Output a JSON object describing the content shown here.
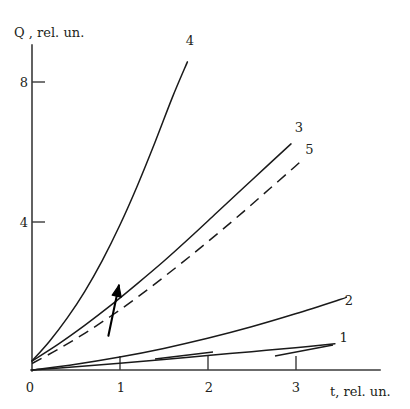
{
  "chart_data": {
    "type": "line",
    "title": "",
    "xlabel": "t, rel. un.",
    "ylabel": "Q , rel. un.",
    "xlim": [
      0,
      3.9
    ],
    "ylim": [
      0,
      9.6
    ],
    "xticks": [
      0,
      1,
      2,
      3
    ],
    "xtick_labels": [
      "0",
      "1",
      "2",
      "3"
    ],
    "yticks": [
      4,
      8
    ],
    "ytick_labels": [
      "4",
      "8"
    ],
    "grid": false,
    "legend": "inline-end-labels",
    "annotations": [
      {
        "name": "upward-arrow",
        "description": "arrow pointing up-left between curves near t=0.9",
        "from_xy": [
          0.87,
          0.95
        ],
        "to_xy": [
          0.99,
          2.35
        ]
      }
    ],
    "series": [
      {
        "name": "1",
        "label": "1",
        "style": "solid",
        "label_xy": [
          3.55,
          0.78
        ],
        "points": [
          [
            0.0,
            0.0
          ],
          [
            0.5,
            0.09
          ],
          [
            1.0,
            0.19
          ],
          [
            1.5,
            0.29
          ],
          [
            2.0,
            0.4
          ],
          [
            2.5,
            0.51
          ],
          [
            3.0,
            0.62
          ],
          [
            3.45,
            0.73
          ]
        ]
      },
      {
        "name": "2",
        "label": "2",
        "style": "solid",
        "label_xy": [
          3.61,
          1.82
        ],
        "points": [
          [
            0.0,
            0.0
          ],
          [
            0.5,
            0.16
          ],
          [
            1.0,
            0.36
          ],
          [
            1.5,
            0.6
          ],
          [
            2.0,
            0.88
          ],
          [
            2.5,
            1.2
          ],
          [
            3.0,
            1.56
          ],
          [
            3.5,
            1.95
          ],
          [
            3.58,
            2.02
          ]
        ]
      },
      {
        "name": "3",
        "label": "3",
        "style": "solid",
        "label_xy": [
          3.04,
          6.6
        ],
        "points": [
          [
            0.0,
            0.25
          ],
          [
            0.3,
            0.72
          ],
          [
            0.6,
            1.24
          ],
          [
            0.9,
            1.8
          ],
          [
            1.2,
            2.4
          ],
          [
            1.5,
            3.02
          ],
          [
            1.8,
            3.68
          ],
          [
            2.1,
            4.36
          ],
          [
            2.4,
            5.04
          ],
          [
            2.7,
            5.72
          ],
          [
            2.95,
            6.28
          ]
        ]
      },
      {
        "name": "4",
        "label": "4",
        "style": "solid",
        "label_xy": [
          1.8,
          9.02
        ],
        "points": [
          [
            0.0,
            0.25
          ],
          [
            0.2,
            0.8
          ],
          [
            0.4,
            1.44
          ],
          [
            0.6,
            2.18
          ],
          [
            0.8,
            3.04
          ],
          [
            1.0,
            4.02
          ],
          [
            1.2,
            5.12
          ],
          [
            1.4,
            6.32
          ],
          [
            1.6,
            7.58
          ],
          [
            1.77,
            8.56
          ]
        ]
      },
      {
        "name": "5",
        "label": "5",
        "style": "dashed",
        "label_xy": [
          3.16,
          6.0
        ],
        "points": [
          [
            0.0,
            0.18
          ],
          [
            0.3,
            0.58
          ],
          [
            0.6,
            1.02
          ],
          [
            0.9,
            1.5
          ],
          [
            1.2,
            2.02
          ],
          [
            1.5,
            2.58
          ],
          [
            1.8,
            3.16
          ],
          [
            2.1,
            3.76
          ],
          [
            2.4,
            4.38
          ],
          [
            2.7,
            5.02
          ],
          [
            3.0,
            5.66
          ],
          [
            3.08,
            5.84
          ]
        ]
      }
    ]
  },
  "axes": {
    "y_axis_title": "Q , rel. un.",
    "x_axis_title": "t, rel. un.",
    "origin_label": "0"
  }
}
